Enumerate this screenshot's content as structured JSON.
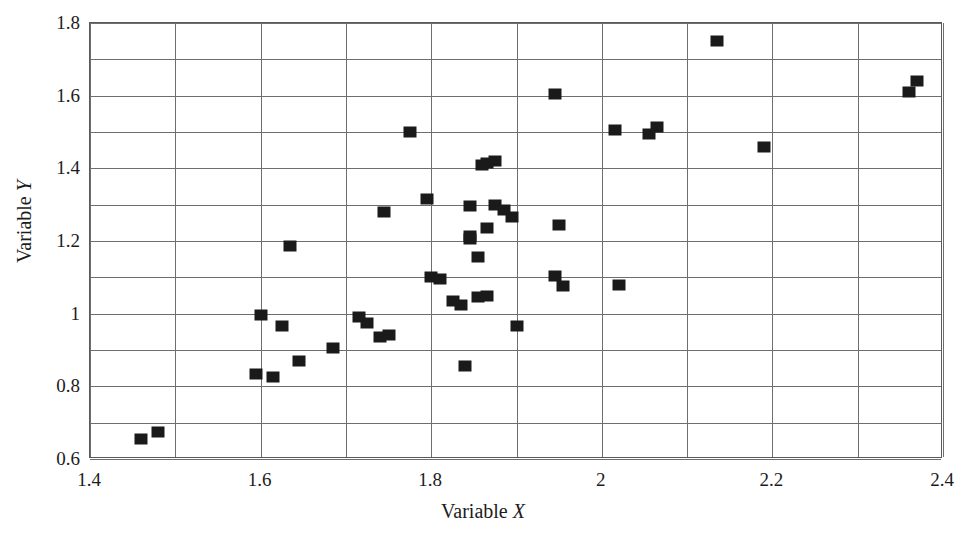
{
  "chart": {
    "type": "scatter",
    "title": "",
    "xlabel_prefix": "Variable ",
    "xlabel_symbol": "X",
    "ylabel_prefix": "Variable ",
    "ylabel_symbol": "Y",
    "marker": "filled-square",
    "marker_color": "#1a1a1a",
    "grid": "major-and-minor",
    "legend": "none"
  },
  "chart_data": {
    "type": "scatter",
    "title": "",
    "xlabel": "Variable X",
    "ylabel": "Variable Y",
    "xlim": [
      1.4,
      2.4
    ],
    "ylim": [
      0.6,
      1.8
    ],
    "xticks": [
      "1.4",
      "1.6",
      "1.8",
      "2",
      "2.2",
      "2.4"
    ],
    "xtick_values": [
      1.4,
      1.6,
      1.8,
      2.0,
      2.2,
      2.4
    ],
    "yticks": [
      "0.6",
      "0.8",
      "1",
      "1.2",
      "1.4",
      "1.6",
      "1.8"
    ],
    "ytick_values": [
      0.6,
      0.8,
      1.0,
      1.2,
      1.4,
      1.6,
      1.8
    ],
    "x_gridlines": [
      1.4,
      1.5,
      1.6,
      1.7,
      1.8,
      1.9,
      2.0,
      2.1,
      2.2,
      2.3,
      2.4
    ],
    "y_gridlines": [
      0.6,
      0.7,
      0.8,
      0.9,
      1.0,
      1.1,
      1.2,
      1.3,
      1.4,
      1.5,
      1.6,
      1.7,
      1.8
    ],
    "grid": true,
    "legend_position": "none",
    "series": [
      {
        "name": "data",
        "marker": "square",
        "color": "#1a1a1a",
        "points": [
          [
            1.46,
            0.655
          ],
          [
            1.48,
            0.675
          ],
          [
            1.595,
            0.835
          ],
          [
            1.615,
            0.825
          ],
          [
            1.6,
            0.995
          ],
          [
            1.625,
            0.965
          ],
          [
            1.635,
            1.185
          ],
          [
            1.645,
            0.87
          ],
          [
            1.685,
            0.905
          ],
          [
            1.715,
            0.99
          ],
          [
            1.725,
            0.975
          ],
          [
            1.74,
            0.935
          ],
          [
            1.75,
            0.94
          ],
          [
            1.745,
            1.28
          ],
          [
            1.775,
            1.5
          ],
          [
            1.795,
            1.315
          ],
          [
            1.8,
            1.1
          ],
          [
            1.81,
            1.095
          ],
          [
            1.825,
            1.035
          ],
          [
            1.835,
            1.025
          ],
          [
            1.84,
            0.855
          ],
          [
            1.845,
            1.205
          ],
          [
            1.845,
            1.215
          ],
          [
            1.845,
            1.295
          ],
          [
            1.855,
            1.155
          ],
          [
            1.855,
            1.045
          ],
          [
            1.865,
            1.05
          ],
          [
            1.86,
            1.41
          ],
          [
            1.865,
            1.415
          ],
          [
            1.865,
            1.235
          ],
          [
            1.875,
            1.42
          ],
          [
            1.875,
            1.3
          ],
          [
            1.885,
            1.285
          ],
          [
            1.895,
            1.265
          ],
          [
            1.9,
            0.965
          ],
          [
            1.945,
            1.605
          ],
          [
            1.95,
            1.245
          ],
          [
            1.945,
            1.105
          ],
          [
            1.955,
            1.075
          ],
          [
            2.015,
            1.505
          ],
          [
            2.02,
            1.08
          ],
          [
            2.055,
            1.495
          ],
          [
            2.065,
            1.515
          ],
          [
            2.135,
            1.75
          ],
          [
            2.19,
            1.46
          ],
          [
            2.36,
            1.61
          ],
          [
            2.37,
            1.64
          ]
        ]
      }
    ]
  }
}
